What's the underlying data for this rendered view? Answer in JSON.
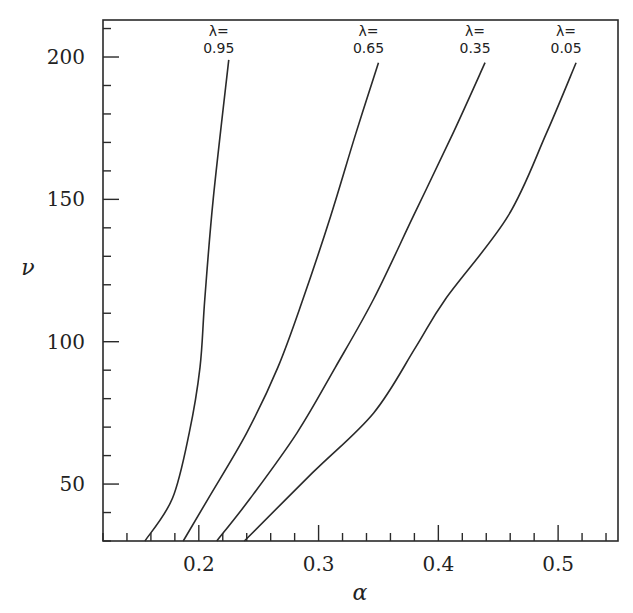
{
  "chart_data": {
    "type": "line",
    "title": "",
    "xlabel": "α",
    "ylabel": "ν",
    "xlim": [
      0.12,
      0.55
    ],
    "ylim": [
      30,
      213
    ],
    "grid": false,
    "legend": "inline labels at top of each curve",
    "x_ticks": [
      0.2,
      0.3,
      0.4,
      0.5
    ],
    "x_tick_labels": [
      "0.2",
      "0.3",
      "0.4",
      "0.5"
    ],
    "x_minor_step": 0.02,
    "y_ticks": [
      50,
      100,
      150,
      200
    ],
    "y_tick_labels": [
      "50",
      "100",
      "150",
      "200"
    ],
    "y_minor_step": 10,
    "series": [
      {
        "name": "λ=0.95",
        "label_top": "λ=",
        "label_bottom": "0.95",
        "points": [
          [
            0.155,
            30
          ],
          [
            0.178,
            45
          ],
          [
            0.192,
            68
          ],
          [
            0.201,
            91
          ],
          [
            0.205,
            115
          ],
          [
            0.212,
            150
          ],
          [
            0.225,
            199
          ]
        ]
      },
      {
        "name": "λ=0.65",
        "label_top": "λ=",
        "label_bottom": "0.65",
        "points": [
          [
            0.187,
            30
          ],
          [
            0.208,
            45
          ],
          [
            0.24,
            68
          ],
          [
            0.266,
            91
          ],
          [
            0.287,
            115
          ],
          [
            0.31,
            144
          ],
          [
            0.331,
            173
          ],
          [
            0.35,
            198
          ]
        ]
      },
      {
        "name": "λ=0.35",
        "label_top": "λ=",
        "label_bottom": "0.35",
        "points": [
          [
            0.215,
            30
          ],
          [
            0.243,
            45
          ],
          [
            0.282,
            68
          ],
          [
            0.314,
            91
          ],
          [
            0.346,
            115
          ],
          [
            0.379,
            144
          ],
          [
            0.412,
            173
          ],
          [
            0.439,
            198
          ]
        ]
      },
      {
        "name": "λ=0.05",
        "label_top": "λ=",
        "label_bottom": "0.05",
        "points": [
          [
            0.238,
            30
          ],
          [
            0.295,
            54
          ],
          [
            0.346,
            75
          ],
          [
            0.381,
            98
          ],
          [
            0.406,
            115
          ],
          [
            0.458,
            144
          ],
          [
            0.49,
            173
          ],
          [
            0.515,
            198
          ]
        ]
      }
    ]
  },
  "colors": {
    "line": "#2a2a2a",
    "axis": "#2a2a2a",
    "background": "#ffffff"
  }
}
